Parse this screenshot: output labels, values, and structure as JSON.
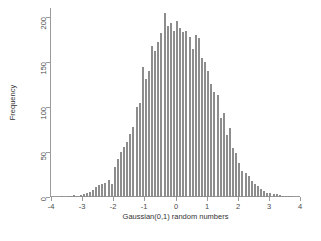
{
  "chart_data": {
    "type": "bar",
    "title": "",
    "subtitle": "",
    "xlabel": "Gaussian(0,1) random numbers",
    "ylabel": "Frequency",
    "xlim": [
      -4,
      4
    ],
    "ylim": [
      0,
      210
    ],
    "grid": false,
    "legend": null,
    "bar_color": "#8d8d8d",
    "plot_background": "#ffffff",
    "page_background": "#ffffff",
    "axis_color": "#9a9a9a",
    "bin_width": 0.1,
    "xticks": [
      -4,
      -3,
      -2,
      -1,
      0,
      1,
      2,
      3,
      4
    ],
    "xtick_labels": [
      "-4",
      "-3",
      "-2",
      "-1",
      "0",
      "1",
      "2",
      "3",
      "4"
    ],
    "yticks": [
      0,
      50,
      100,
      150,
      200
    ],
    "ytick_labels": [
      "0",
      "50",
      "100",
      "150",
      "200"
    ],
    "bin_centers": [
      -3.65,
      -3.55,
      -3.45,
      -3.35,
      -3.25,
      -3.15,
      -3.05,
      -2.95,
      -2.85,
      -2.75,
      -2.65,
      -2.55,
      -2.45,
      -2.35,
      -2.25,
      -2.15,
      -2.05,
      -1.95,
      -1.85,
      -1.75,
      -1.65,
      -1.55,
      -1.45,
      -1.35,
      -1.25,
      -1.15,
      -1.05,
      -0.95,
      -0.85,
      -0.75,
      -0.65,
      -0.55,
      -0.45,
      -0.35,
      -0.25,
      -0.15,
      -0.05,
      0.05,
      0.15,
      0.25,
      0.35,
      0.45,
      0.55,
      0.65,
      0.75,
      0.85,
      0.95,
      1.05,
      1.15,
      1.25,
      1.35,
      1.45,
      1.55,
      1.65,
      1.75,
      1.85,
      1.95,
      2.05,
      2.15,
      2.25,
      2.35,
      2.45,
      2.55,
      2.65,
      2.75,
      2.85,
      2.95,
      3.05,
      3.15,
      3.25,
      3.35,
      3.45,
      3.55,
      3.65,
      3.75
    ],
    "counts": [
      1,
      0,
      1,
      1,
      2,
      1,
      2,
      3,
      4,
      6,
      8,
      11,
      13,
      14,
      16,
      19,
      14,
      33,
      42,
      50,
      56,
      61,
      70,
      78,
      100,
      104,
      145,
      131,
      140,
      168,
      162,
      172,
      182,
      205,
      190,
      193,
      185,
      196,
      188,
      183,
      185,
      178,
      165,
      180,
      177,
      155,
      150,
      140,
      126,
      117,
      113,
      88,
      93,
      69,
      77,
      55,
      49,
      38,
      29,
      27,
      23,
      18,
      15,
      12,
      9,
      7,
      5,
      4,
      3,
      3,
      2,
      1,
      1,
      1,
      1
    ]
  }
}
